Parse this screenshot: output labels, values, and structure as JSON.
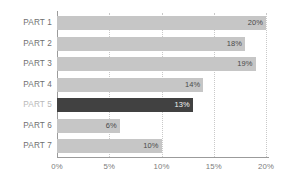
{
  "chart_data": {
    "type": "bar",
    "orientation": "horizontal",
    "title": "",
    "subtitle": "",
    "xlabel": "",
    "ylabel": "",
    "categories": [
      "PART 1",
      "PART 2",
      "PART 3",
      "PART 4",
      "PART 5",
      "PART 6",
      "PART 7"
    ],
    "values": [
      20,
      18,
      19,
      14,
      13,
      6,
      10
    ],
    "value_labels": [
      "20%",
      "18%",
      "19%",
      "14%",
      "13%",
      "6%",
      "10%"
    ],
    "highlight_index": 4,
    "xlim": [
      0,
      20
    ],
    "xtick_values": [
      0,
      5,
      10,
      15,
      20
    ],
    "xtick_labels": [
      "0%",
      "5%",
      "10%",
      "15%",
      "20%"
    ],
    "grid": "vertical-dotted",
    "legend": null,
    "colors": {
      "bar": "#c6c6c6",
      "bar_highlight": "#414141",
      "value_text": "#4a4a4a",
      "value_text_on_highlight": "#f2f2f2",
      "category_text": "#6f6f6f",
      "category_text_dim": "#b9b9b9",
      "tick_text": "#7c7c7c",
      "axis": "#9b9b9b",
      "gridline": "#c9c9c9",
      "background": "#ffffff"
    }
  }
}
